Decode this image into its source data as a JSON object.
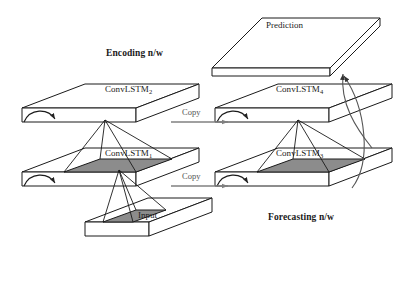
{
  "figure": {
    "title_alt": "ConvLSTM encoding-forecasting network diagram",
    "background_color": "#ffffff",
    "line_color": "#1a1a1a",
    "patch_fill_color": "#8c8c8c",
    "copy_arrow_color": "#808080",
    "slab_face_color": "#ffffff"
  },
  "labels": {
    "encoding_network": "Encoding n/w",
    "forecasting_network": "Forecasting n/w",
    "prediction": "Prediction",
    "input": "Input",
    "copy_upper": "Copy",
    "copy_lower": "Copy"
  },
  "layers": {
    "conv_lstm_1": {
      "name": "ConvLSTM",
      "index": "1"
    },
    "conv_lstm_2": {
      "name": "ConvLSTM",
      "index": "2"
    },
    "conv_lstm_3": {
      "name": "ConvLSTM",
      "index": "3"
    },
    "conv_lstm_4": {
      "name": "ConvLSTM",
      "index": "4"
    }
  },
  "structure": {
    "encoding_stack": [
      "Input",
      "ConvLSTM1",
      "ConvLSTM2"
    ],
    "forecasting_stack": [
      "ConvLSTM3",
      "ConvLSTM4",
      "Prediction"
    ],
    "copy_connections": 2,
    "recurrent_arrows": 4,
    "prediction_arrows": 2
  }
}
